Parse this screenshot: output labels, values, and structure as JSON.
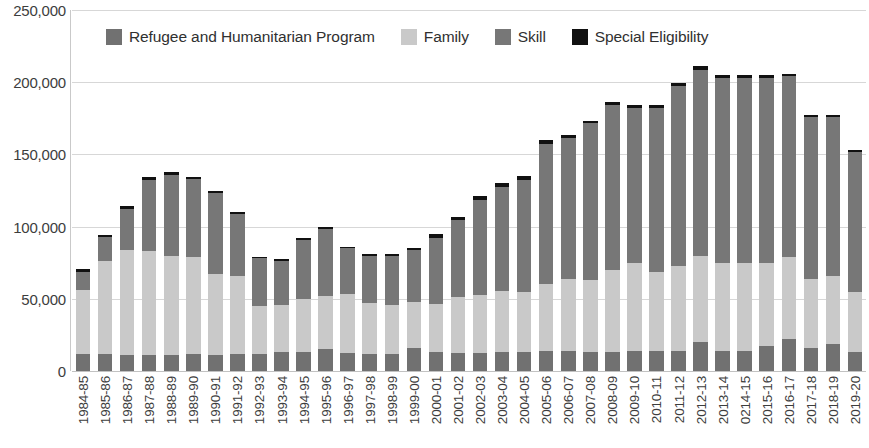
{
  "chart_data": {
    "type": "bar",
    "subtype": "stacked-bar",
    "title": "",
    "subtitle": "",
    "xlabel": "",
    "ylabel": "",
    "ylim": [
      0,
      250000
    ],
    "ytick_step": 50000,
    "ytick_labels": [
      "250,000",
      "200,000",
      "150,000",
      "100,000",
      "50,000",
      "0"
    ],
    "ytick_values": [
      250000,
      200000,
      150000,
      100000,
      50000,
      0
    ],
    "grid": true,
    "legend_position": "top-inside",
    "categories": [
      "1984-85",
      "1985-86",
      "1986-87",
      "1987-88",
      "1988-89",
      "1989-90",
      "1990-91",
      "1991-92",
      "1992-93",
      "1993-94",
      "1994-95",
      "1995-96",
      "1996-97",
      "1997-98",
      "1998-99",
      "1999-00",
      "2000-01",
      "2001-02",
      "2002-03",
      "2003-04",
      "2004-05",
      "2005-06",
      "2006-07",
      "2007-08",
      "2008-09",
      "2009-10",
      "2010-11",
      "2011-12",
      "2012-13",
      "2013-14",
      "0214-15",
      "2015-16",
      "2016-17",
      "2017-18",
      "2018-19",
      "2019-20"
    ],
    "series": [
      {
        "name": "Refugee and Humanitarian Program",
        "color": "#717171",
        "values": [
          11500,
          11500,
          11300,
          11300,
          11000,
          11500,
          11000,
          11500,
          12000,
          13500,
          13000,
          15500,
          12500,
          12000,
          12000,
          16000,
          13000,
          12500,
          12500,
          13000,
          13300,
          14100,
          13600,
          13000,
          13500,
          13800,
          13800,
          13800,
          20000,
          13800,
          13800,
          17600,
          21900,
          16200,
          18800,
          13200
        ]
      },
      {
        "name": "Family",
        "color": "#c9c9c9",
        "values": [
          44500,
          64500,
          72700,
          71700,
          69000,
          67500,
          56000,
          54500,
          33000,
          32500,
          37000,
          36500,
          40500,
          35000,
          34000,
          32000,
          33500,
          38500,
          40000,
          42200,
          41700,
          45900,
          50400,
          50000,
          56500,
          60700,
          54700,
          58700,
          60000,
          61200,
          61200,
          57400,
          57100,
          47800,
          47200,
          41800
        ]
      },
      {
        "name": "Skill",
        "color": "#777777",
        "values": [
          12500,
          16500,
          28000,
          49000,
          55500,
          54000,
          56000,
          43000,
          33000,
          30500,
          41000,
          46500,
          32000,
          33000,
          34000,
          35500,
          45500,
          53500,
          66000,
          72000,
          77000,
          97000,
          97500,
          108500,
          114000,
          107500,
          113800,
          125000,
          128500,
          128000,
          128000,
          128000,
          125000,
          112000,
          110000,
          96500
        ]
      },
      {
        "name": "Special Eligibility",
        "color": "#111111",
        "values": [
          2000,
          1800,
          2200,
          2200,
          2000,
          1700,
          1500,
          1200,
          1200,
          900,
          1200,
          1200,
          1200,
          1200,
          1200,
          1900,
          2800,
          2300,
          2800,
          3000,
          3000,
          2800,
          2200,
          2000,
          2000,
          2300,
          2000,
          2300,
          2500,
          2000,
          2000,
          2000,
          2000,
          1500,
          1500,
          1300
        ]
      }
    ],
    "legend": [
      {
        "label": "Refugee and Humanitarian Program",
        "swatch_name": "legend-swatch-refugee",
        "color": "#717171"
      },
      {
        "label": "Family",
        "swatch_name": "legend-swatch-family",
        "color": "#c9c9c9"
      },
      {
        "label": "Skill",
        "swatch_name": "legend-swatch-skill",
        "color": "#777777"
      },
      {
        "label": "Special Eligibility",
        "swatch_name": "legend-swatch-special",
        "color": "#111111"
      }
    ]
  }
}
